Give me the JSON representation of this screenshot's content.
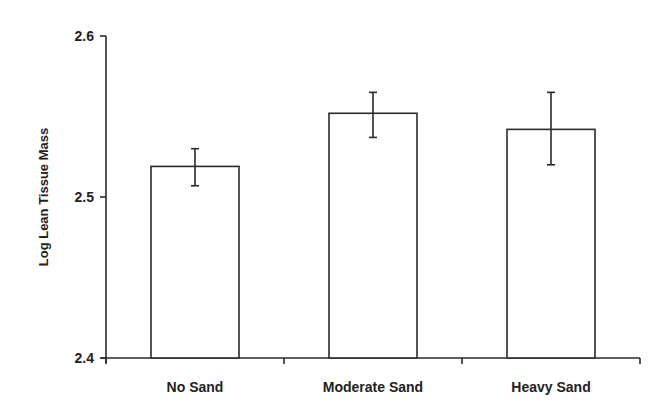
{
  "chart_data": {
    "type": "bar",
    "title": "",
    "xlabel": "",
    "ylabel": "Log Lean Tissue Mass",
    "ylim": [
      2.4,
      2.6
    ],
    "yticks": [
      "2.4",
      "2.5",
      "2.6"
    ],
    "categories": [
      "No Sand",
      "Moderate Sand",
      "Heavy Sand"
    ],
    "values": [
      2.519,
      2.552,
      2.542
    ],
    "error_bars": [
      {
        "upper": 2.53,
        "lower": 2.507
      },
      {
        "upper": 2.565,
        "lower": 2.537
      },
      {
        "upper": 2.565,
        "lower": 2.52
      }
    ],
    "grid": false,
    "legend": null,
    "bar_fill": "#ffffff",
    "bar_stroke": "#2a2a2a"
  }
}
